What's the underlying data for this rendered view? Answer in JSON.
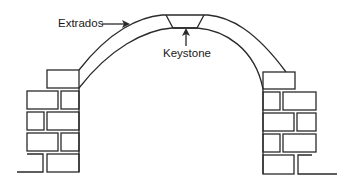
{
  "diagram": {
    "title": "",
    "type": "arch structure",
    "labels": {
      "extrados": "Extrados",
      "keystone": "Keystone"
    },
    "colors": {
      "line": "#2a2a2a",
      "background": "#ffffff"
    }
  }
}
